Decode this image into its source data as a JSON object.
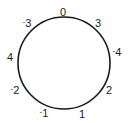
{
  "diagram": {
    "type": "number-circle",
    "circle": {
      "cx": 64,
      "cy": 63,
      "r": 46,
      "stroke": "#1a1a1a"
    },
    "labels": [
      {
        "id": "top",
        "sign": "",
        "value": "0",
        "x": 63,
        "y": 12
      },
      {
        "id": "upper-right",
        "sign": "",
        "value": "3",
        "x": 98,
        "y": 23
      },
      {
        "id": "right",
        "sign": "-",
        "value": "4",
        "x": 117,
        "y": 53
      },
      {
        "id": "lower-right",
        "sign": "",
        "value": "2",
        "x": 109,
        "y": 90
      },
      {
        "id": "bottom-right",
        "sign": "",
        "value": "1",
        "x": 82,
        "y": 114
      },
      {
        "id": "bottom-left",
        "sign": "-",
        "value": "1",
        "x": 44,
        "y": 114
      },
      {
        "id": "lower-left",
        "sign": "-",
        "value": "2",
        "x": 15,
        "y": 91
      },
      {
        "id": "left",
        "sign": "",
        "value": "4",
        "x": 10,
        "y": 57
      },
      {
        "id": "upper-left",
        "sign": "-",
        "value": "3",
        "x": 27,
        "y": 24
      }
    ]
  }
}
